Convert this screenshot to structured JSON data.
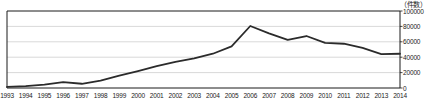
{
  "chart_data": {
    "type": "line",
    "title": "",
    "subtitle": "",
    "xlabel": "",
    "ylabel": "",
    "unit_label": "（件数）",
    "categories": [
      "1993",
      "1994",
      "1995",
      "1996",
      "1997",
      "1998",
      "1999",
      "2000",
      "2001",
      "2002",
      "2003",
      "2004",
      "2005",
      "2006",
      "2007",
      "2008",
      "2009",
      "2010",
      "2011",
      "2012",
      "2013",
      "2014"
    ],
    "values": [
      1500,
      2500,
      4500,
      7500,
      5500,
      9500,
      16000,
      22000,
      28500,
      34000,
      38500,
      44500,
      54000,
      80500,
      71000,
      62500,
      67500,
      58500,
      57500,
      52000,
      44000,
      44500
    ],
    "ylim": [
      0,
      100000
    ],
    "yticks": [
      0,
      20000,
      40000,
      60000,
      80000,
      100000
    ],
    "ytick_labels": [
      "0",
      "20000",
      "40000",
      "60000",
      "80000",
      "100000"
    ],
    "xlim": [
      "1993",
      "2014"
    ],
    "grid": true,
    "grid_axis": "y",
    "legend": "none",
    "series_color": "#2b2b2b",
    "grid_color": "#c9c9c9",
    "axis_color": "#1a1a1a",
    "background": "#ffffff"
  }
}
